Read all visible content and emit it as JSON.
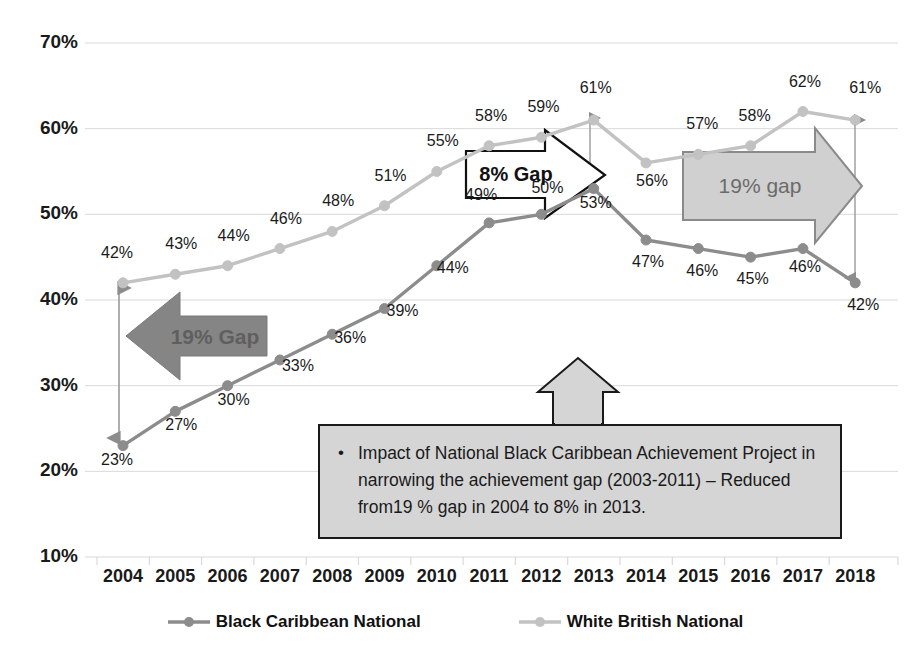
{
  "chart_data": {
    "type": "line",
    "title": "",
    "xlabel": "",
    "ylabel": "",
    "categories": [
      "2004",
      "2005",
      "2006",
      "2007",
      "2008",
      "2009",
      "2010",
      "2011",
      "2012",
      "2013",
      "2014",
      "2015",
      "2016",
      "2017",
      "2018"
    ],
    "ylim": [
      10,
      70
    ],
    "ytick_labels": [
      "70%",
      "60%",
      "50%",
      "40%",
      "30%",
      "20%",
      "10%"
    ],
    "ytick_values": [
      70,
      60,
      50,
      40,
      30,
      20,
      10
    ],
    "grid": true,
    "legend_position": "bottom",
    "series": [
      {
        "name": "Black Caribbean National",
        "color": "#8c8c8c",
        "values": [
          23,
          27,
          30,
          33,
          36,
          39,
          44,
          49,
          50,
          53,
          47,
          46,
          45,
          46,
          42
        ],
        "value_labels": [
          "23%",
          "27%",
          "30%",
          "33%",
          "36%",
          "39%",
          "44%",
          "49%",
          "50%",
          "53%",
          "47%",
          "46%",
          "45%",
          "46%",
          "42%"
        ]
      },
      {
        "name": "White British National",
        "color": "#c2c2c2",
        "values": [
          42,
          43,
          44,
          46,
          48,
          51,
          55,
          58,
          59,
          61,
          56,
          57,
          58,
          62,
          61
        ],
        "value_labels": [
          "42%",
          "43%",
          "44%",
          "46%",
          "48%",
          "51%",
          "55%",
          "58%",
          "59%",
          "61%",
          "56%",
          "57%",
          "58%",
          "62%",
          "61%"
        ]
      }
    ],
    "annotations": [
      {
        "name": "gap-arrow-left",
        "text": "19% Gap",
        "direction": "left",
        "style": "solid-dark-gray",
        "at_year": "2004",
        "gap_value": 19
      },
      {
        "name": "gap-arrow-middle",
        "text": "8% Gap",
        "direction": "right",
        "style": "white-outline",
        "at_year": "2013",
        "gap_value": 8
      },
      {
        "name": "gap-arrow-right",
        "text": "19% gap",
        "direction": "right",
        "style": "light-gray-fill",
        "at_year": "2018",
        "gap_value": 19
      },
      {
        "name": "callout-box",
        "text": "Impact of National Black Caribbean Achievement Project  in narrowing the achievement  gap (2003-2011) – Reduced from19 % gap in 2004 to 8% in 2013."
      }
    ]
  },
  "axes": {
    "y_labels": [
      "70%",
      "60%",
      "50%",
      "40%",
      "30%",
      "20%",
      "10%"
    ],
    "x_labels": [
      "2004",
      "2005",
      "2006",
      "2007",
      "2008",
      "2009",
      "2010",
      "2011",
      "2012",
      "2013",
      "2014",
      "2015",
      "2016",
      "2017",
      "2018"
    ]
  },
  "annotations": {
    "gap_left": "19% Gap",
    "gap_middle": "8% Gap",
    "gap_right": "19% gap",
    "callout_bullet": "•",
    "callout_body": "Impact of National Black Caribbean Achievement Project  in narrowing the achievement  gap (2003-2011) – Reduced from19 % gap in 2004 to 8% in 2013."
  },
  "legend": {
    "items": [
      {
        "label": "Black Caribbean National",
        "color": "#8c8c8c"
      },
      {
        "label": "White British National",
        "color": "#c2c2c2"
      }
    ]
  },
  "colors": {
    "black_caribbean": "#8c8c8c",
    "white_british": "#c2c2c2",
    "grid": "#d9d9d9",
    "arrow_left_fill": "#858585",
    "arrow_right_fill": "#d0d0d0",
    "arrow_right_stroke": "#8a8a8a",
    "callout_bg": "#d5d5d5",
    "callout_border": "#1a1a1a",
    "text": "#1a1a1a"
  }
}
